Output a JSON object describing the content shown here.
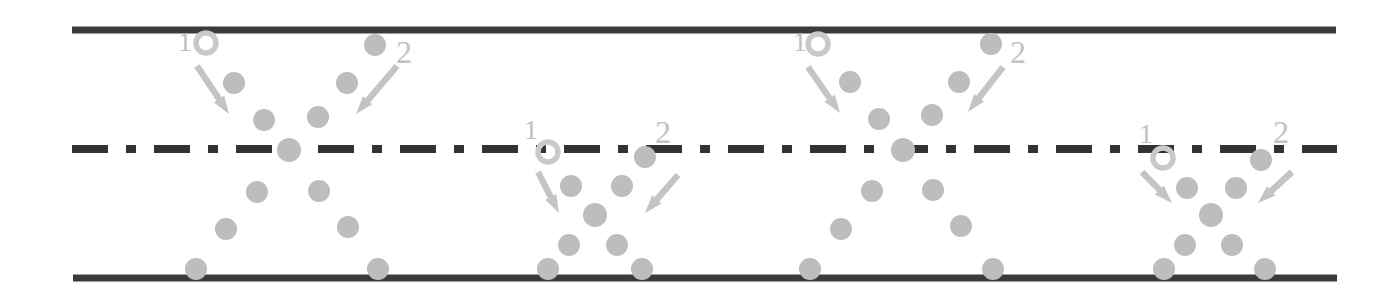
{
  "figure": {
    "domain": "diagram",
    "title": "",
    "background_color": "#ffffff",
    "width": 1399,
    "height": 293
  },
  "palette": {
    "wall_color": "#3b3b3b",
    "centerline_color": "#333333",
    "particle_color": "#bdbdbd",
    "marker_color": "#c9c9c9",
    "arrow_color": "#c4c4c4",
    "label_color": "#c0c0c0"
  },
  "walls": {
    "top": {
      "name": "top-wall",
      "x1": 72,
      "x2": 1336,
      "y": 30,
      "thickness": 7
    },
    "bottom": {
      "name": "bottom-wall",
      "x1": 73,
      "x2": 1337,
      "y": 278,
      "thickness": 7
    }
  },
  "centerline": {
    "name": "centerline",
    "x1": 72,
    "x2": 1337,
    "y": 149,
    "thickness": 8,
    "pattern": "dash-dot",
    "dash_length": 36,
    "dot_length": 10,
    "gap_length": 18
  },
  "labels": {
    "injector_label": "1",
    "injector_label_2": "2"
  },
  "clusters": [
    {
      "name": "cluster-1",
      "origin": "top-wall",
      "marker": {
        "cx": 206,
        "cy": 43,
        "r_outer": 12,
        "r_inner": 8
      },
      "label_1": {
        "x": 178,
        "y": 28,
        "text": "1"
      },
      "label_2": {
        "x": 396,
        "y": 36,
        "text": "2"
      },
      "arrow_left": {
        "x1": 197,
        "y1": 66,
        "x2": 229,
        "y2": 114
      },
      "arrow_right": {
        "x1": 397,
        "y1": 66,
        "x2": 356,
        "y2": 114
      },
      "particles": [
        {
          "cx": 375,
          "cy": 45,
          "r": 11
        },
        {
          "cx": 234,
          "cy": 83,
          "r": 11
        },
        {
          "cx": 347,
          "cy": 83,
          "r": 11
        },
        {
          "cx": 264,
          "cy": 120,
          "r": 11
        },
        {
          "cx": 318,
          "cy": 117,
          "r": 11
        },
        {
          "cx": 289,
          "cy": 150,
          "r": 12
        },
        {
          "cx": 257,
          "cy": 192,
          "r": 11
        },
        {
          "cx": 319,
          "cy": 191,
          "r": 11
        },
        {
          "cx": 226,
          "cy": 229,
          "r": 11
        },
        {
          "cx": 348,
          "cy": 227,
          "r": 11
        },
        {
          "cx": 196,
          "cy": 269,
          "r": 11
        },
        {
          "cx": 378,
          "cy": 269,
          "r": 11
        }
      ]
    },
    {
      "name": "cluster-2",
      "origin": "centerline",
      "marker": {
        "cx": 548,
        "cy": 152,
        "r_outer": 12,
        "r_inner": 8
      },
      "label_1": {
        "x": 524,
        "y": 116,
        "text": "1"
      },
      "label_2": {
        "x": 655,
        "y": 116,
        "text": "2"
      },
      "arrow_left": {
        "x1": 538,
        "y1": 172,
        "x2": 559,
        "y2": 213
      },
      "arrow_right": {
        "x1": 678,
        "y1": 175,
        "x2": 645,
        "y2": 213
      },
      "particles": [
        {
          "cx": 645,
          "cy": 157,
          "r": 11
        },
        {
          "cx": 571,
          "cy": 186,
          "r": 11
        },
        {
          "cx": 622,
          "cy": 186,
          "r": 11
        },
        {
          "cx": 595,
          "cy": 215,
          "r": 12
        },
        {
          "cx": 569,
          "cy": 245,
          "r": 11
        },
        {
          "cx": 617,
          "cy": 245,
          "r": 11
        },
        {
          "cx": 548,
          "cy": 269,
          "r": 11
        },
        {
          "cx": 642,
          "cy": 269,
          "r": 11
        }
      ]
    },
    {
      "name": "cluster-3",
      "origin": "top-wall",
      "marker": {
        "cx": 818,
        "cy": 44,
        "r_outer": 12,
        "r_inner": 8
      },
      "label_1": {
        "x": 793,
        "y": 28,
        "text": "1"
      },
      "label_2": {
        "x": 1010,
        "y": 36,
        "text": "2"
      },
      "arrow_left": {
        "x1": 808,
        "y1": 67,
        "x2": 840,
        "y2": 113
      },
      "arrow_right": {
        "x1": 1003,
        "y1": 67,
        "x2": 968,
        "y2": 112
      },
      "particles": [
        {
          "cx": 991,
          "cy": 44,
          "r": 11
        },
        {
          "cx": 850,
          "cy": 82,
          "r": 11
        },
        {
          "cx": 959,
          "cy": 82,
          "r": 11
        },
        {
          "cx": 879,
          "cy": 119,
          "r": 11
        },
        {
          "cx": 932,
          "cy": 115,
          "r": 11
        },
        {
          "cx": 903,
          "cy": 150,
          "r": 12
        },
        {
          "cx": 872,
          "cy": 191,
          "r": 11
        },
        {
          "cx": 933,
          "cy": 190,
          "r": 11
        },
        {
          "cx": 841,
          "cy": 229,
          "r": 11
        },
        {
          "cx": 961,
          "cy": 226,
          "r": 11
        },
        {
          "cx": 810,
          "cy": 269,
          "r": 11
        },
        {
          "cx": 993,
          "cy": 269,
          "r": 11
        }
      ]
    },
    {
      "name": "cluster-4",
      "origin": "centerline",
      "marker": {
        "cx": 1163,
        "cy": 158,
        "r_outer": 12,
        "r_inner": 8
      },
      "label_1": {
        "x": 1139,
        "y": 120,
        "text": "1"
      },
      "label_2": {
        "x": 1273,
        "y": 116,
        "text": "2"
      },
      "arrow_left": {
        "x1": 1142,
        "y1": 172,
        "x2": 1172,
        "y2": 203
      },
      "arrow_right": {
        "x1": 1292,
        "y1": 172,
        "x2": 1258,
        "y2": 203
      },
      "particles": [
        {
          "cx": 1261,
          "cy": 160,
          "r": 11
        },
        {
          "cx": 1187,
          "cy": 188,
          "r": 11
        },
        {
          "cx": 1236,
          "cy": 188,
          "r": 11
        },
        {
          "cx": 1211,
          "cy": 215,
          "r": 12
        },
        {
          "cx": 1185,
          "cy": 245,
          "r": 11
        },
        {
          "cx": 1232,
          "cy": 245,
          "r": 11
        },
        {
          "cx": 1164,
          "cy": 269,
          "r": 11
        },
        {
          "cx": 1265,
          "cy": 269,
          "r": 11
        }
      ]
    }
  ]
}
